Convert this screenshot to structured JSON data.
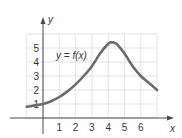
{
  "chart_data": {
    "type": "line",
    "title": "",
    "xlabel": "x",
    "ylabel": "y",
    "curve_label": "y = f(x)",
    "x_ticks": [
      "1",
      "2",
      "3",
      "4",
      "5",
      "6"
    ],
    "y_ticks": [
      "1",
      "2",
      "3",
      "4",
      "5"
    ],
    "xlim": [
      -1,
      7
    ],
    "ylim": [
      0,
      6
    ],
    "grid": true,
    "series": [
      {
        "name": "y = f(x)",
        "x": [
          -1,
          -0.5,
          0,
          0.5,
          1,
          1.5,
          2,
          2.5,
          3,
          3.5,
          4,
          4.2,
          4.5,
          5,
          5.5,
          6,
          6.5,
          7
        ],
        "y": [
          0.8,
          0.9,
          1.0,
          1.2,
          1.5,
          1.9,
          2.4,
          3.0,
          3.7,
          4.6,
          5.3,
          5.4,
          5.3,
          4.6,
          3.7,
          3.0,
          2.5,
          2.0
        ]
      }
    ],
    "colors": {
      "curve": "#6b6b6b",
      "grid": "#dcdcdc",
      "axis": "#4a4a4a"
    }
  }
}
